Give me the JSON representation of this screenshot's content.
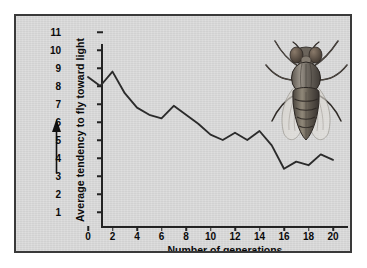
{
  "chart_data": {
    "type": "line",
    "title": "",
    "xlabel": "Number of generations",
    "ylabel": "Average tendency to fly toward light",
    "xlim": [
      0,
      20
    ],
    "ylim": [
      1,
      11
    ],
    "xticks": [
      0,
      2,
      4,
      6,
      8,
      10,
      12,
      14,
      16,
      18,
      20
    ],
    "yticks": [
      1,
      2,
      3,
      4,
      5,
      6,
      7,
      8,
      9,
      10,
      11
    ],
    "grid": false,
    "legend": null,
    "x": [
      0,
      1,
      2,
      3,
      4,
      5,
      6,
      7,
      8,
      9,
      10,
      11,
      12,
      13,
      14,
      15,
      16,
      17,
      18,
      19,
      20
    ],
    "values": [
      8.5,
      8.0,
      8.8,
      7.6,
      6.8,
      6.4,
      6.2,
      6.9,
      6.4,
      5.9,
      5.3,
      5.0,
      5.4,
      5.0,
      5.5,
      4.7,
      3.4,
      3.8,
      3.6,
      4.2,
      3.9
    ],
    "series": [
      {
        "name": "Average tendency to fly toward light",
        "values": [
          8.5,
          8.0,
          8.8,
          7.6,
          6.8,
          6.4,
          6.2,
          6.9,
          6.4,
          5.9,
          5.3,
          5.0,
          5.4,
          5.0,
          5.5,
          4.7,
          3.4,
          3.8,
          3.6,
          4.2,
          3.9
        ]
      }
    ],
    "line_color": "#2b2b2b",
    "background_color": "#d8d8d8",
    "annotations": [
      {
        "name": "fruit-fly-illustration",
        "description": "Drosophila fruit fly drawing, upper right of plot"
      },
      {
        "name": "y-axis-direction-arrow",
        "description": "Upward arrow beside the y-axis label"
      }
    ]
  },
  "axes": {
    "y": {
      "label": "Average tendency to fly toward light",
      "ticks": [
        "11",
        "10",
        "9",
        "8",
        "7",
        "6",
        "5",
        "4",
        "3",
        "2",
        "1"
      ]
    },
    "x": {
      "label": "Number of generations",
      "ticks": [
        "0",
        "2",
        "4",
        "6",
        "8",
        "10",
        "12",
        "14",
        "16",
        "18",
        "20"
      ]
    }
  },
  "colors": {
    "panel_background": "#d8d8d8",
    "panel_border": "#3a3a3a",
    "axis": "#232323",
    "line": "#2b2b2b",
    "text": "#0a0a0a"
  }
}
